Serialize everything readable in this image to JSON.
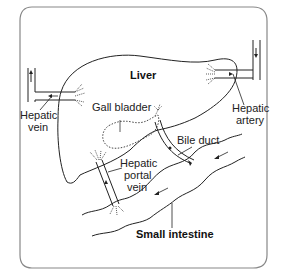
{
  "diagram": {
    "labels": {
      "liver": "Liver",
      "hepatic_vein_1": "Hepatic",
      "hepatic_vein_2": "vein",
      "hepatic_artery_1": "Hepatic",
      "hepatic_artery_2": "artery",
      "gall_bladder": "Gall bladder",
      "bile_duct": "Bile duct",
      "hepatic_portal_1": "Hepatic",
      "hepatic_portal_2": "portal",
      "hepatic_portal_3": "vein",
      "small_intestine": "Small intestine"
    },
    "colors": {
      "stroke": "#222222",
      "frame": "#777777",
      "background": "#ffffff"
    }
  }
}
